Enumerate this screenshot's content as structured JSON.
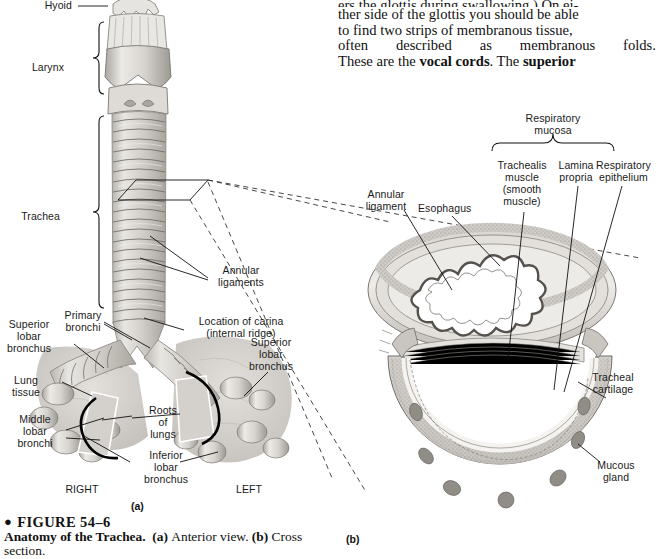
{
  "page": {
    "width": 657,
    "height": 553,
    "background": "#ffffff",
    "ink": "#111111"
  },
  "body_text": {
    "lines": [
      "ers the glottis during swallowing.) On ei-",
      "ther side of the glottis you should be able",
      "to find two strips of membranous tissue,",
      "often described as membranous folds.",
      "These are the "
    ],
    "line5_a": "These are the ",
    "line5_bold1": "vocal cords",
    "line5_b": ". The ",
    "line5_bold2": "superior",
    "justified_line_3_words": [
      "often",
      "described",
      "as",
      "membranous",
      "folds."
    ]
  },
  "caption": {
    "bullet": "●",
    "figure_number": "FIGURE 54–6",
    "title": "Anatomy of the Trachea.",
    "part_a_tag": "(a)",
    "part_a_text": "Anterior view.",
    "part_b_tag": "(b)",
    "part_b_text": "Cross",
    "last_line": "section."
  },
  "panel_a": {
    "mark": "(a)",
    "labels": [
      {
        "id": "hyoid",
        "text": "Hyoid",
        "x": 70,
        "y": 0,
        "align": "right"
      },
      {
        "id": "larynx",
        "text": "Larynx",
        "x": 60,
        "y": 62,
        "align": "right"
      },
      {
        "id": "trachea",
        "text": "Trachea",
        "x": 56,
        "y": 211,
        "align": "right"
      },
      {
        "id": "annular-ligaments",
        "text": "Annular\nligaments",
        "x": 212,
        "y": 265,
        "align": "left"
      },
      {
        "id": "location-of-carina",
        "text": "Location of carina\n(internal ridge)",
        "x": 186,
        "y": 316,
        "align": "left"
      },
      {
        "id": "primary-bronchi",
        "text": "Primary\nbronchi",
        "x": 58,
        "y": 310,
        "align": "left"
      },
      {
        "id": "superior-lobar-bronchus-right",
        "text": "Superior\nlobar\nbronchus",
        "x": 4,
        "y": 319,
        "align": "left"
      },
      {
        "id": "superior-lobar-bronchus-left",
        "text": "Superior\nlobar\nbronchus",
        "x": 243,
        "y": 337,
        "align": "left"
      },
      {
        "id": "lung-tissue",
        "text": "Lung\ntissue",
        "x": 6,
        "y": 375,
        "align": "left"
      },
      {
        "id": "middle-lobar-bronchi",
        "text": "Middle\nlobar\nbronchi",
        "x": 10,
        "y": 414,
        "align": "left"
      },
      {
        "id": "roots-of-lungs",
        "text": "Roots\nof\nlungs",
        "x": 148,
        "y": 405,
        "align": "center"
      },
      {
        "id": "inferior-lobar-bronchus",
        "text": "Inferior\nlobar\nbronchus",
        "x": 140,
        "y": 450,
        "align": "center"
      },
      {
        "id": "right-side",
        "text": "RIGHT",
        "x": 82,
        "y": 484,
        "align": "center"
      },
      {
        "id": "left-side",
        "text": "LEFT",
        "x": 249,
        "y": 484,
        "align": "center"
      }
    ]
  },
  "panel_b": {
    "mark": "(b)",
    "bracket_label": "Respiratory\nmucosa",
    "labels": [
      {
        "id": "respiratory-mucosa",
        "text": "Respiratory\nmucosa",
        "x": 553,
        "y": 113,
        "align": "center"
      },
      {
        "id": "trachealis-muscle",
        "text": "Trachealis\nmuscle\n(smooth\nmuscle)",
        "x": 521,
        "y": 160,
        "align": "center"
      },
      {
        "id": "lamina-propria",
        "text": "Lamina\npropria",
        "x": 577,
        "y": 160,
        "align": "center"
      },
      {
        "id": "respiratory-epithelium",
        "text": "Respiratory\nepithelium",
        "x": 626,
        "y": 160,
        "align": "center"
      },
      {
        "id": "annular-ligament",
        "text": "Annular\nligament",
        "x": 388,
        "y": 189,
        "align": "center"
      },
      {
        "id": "esophagus",
        "text": "Esophagus",
        "x": 443,
        "y": 203,
        "align": "left"
      },
      {
        "id": "tracheal-cartilage",
        "text": "Tracheal\ncartilage",
        "x": 612,
        "y": 372,
        "align": "center"
      },
      {
        "id": "mucous-gland",
        "text": "Mucous\ngland",
        "x": 614,
        "y": 460,
        "align": "center"
      }
    ]
  },
  "colors": {
    "tissue_light": "#e3e1dd",
    "tissue_mid": "#c6c3be",
    "tissue_dark": "#a6a29c",
    "cartilage": "#d8d5d0",
    "lung": "#cfcdc8",
    "outline": "#6f6b66"
  }
}
